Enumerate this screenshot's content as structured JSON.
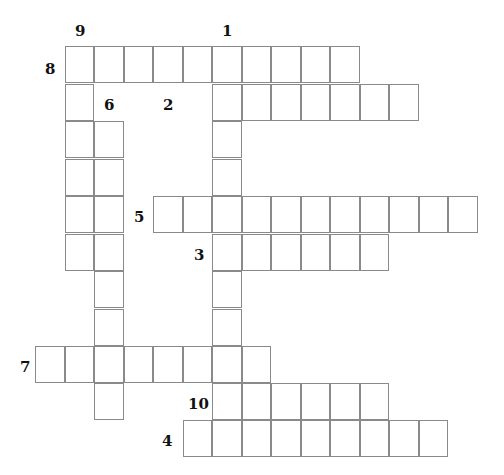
{
  "puzzle": {
    "type": "crossword",
    "grid": {
      "origin_x": 65,
      "cell_width": 29.5,
      "row_tops": [
        46,
        84,
        121,
        159,
        196,
        234,
        271,
        309,
        346,
        383,
        420
      ],
      "cell_height": 37.5
    },
    "clues": [
      {
        "number": "1",
        "direction": "down",
        "col": 5,
        "row": 0,
        "length": 11,
        "label_x": 222,
        "label_y": 22
      },
      {
        "number": "2",
        "direction": "across",
        "col": 5,
        "row": 1,
        "length": 7,
        "label_x": 163,
        "label_y": 96
      },
      {
        "number": "3",
        "direction": "across",
        "col": 5,
        "row": 5,
        "length": 6,
        "label_x": 194,
        "label_y": 246
      },
      {
        "number": "4",
        "direction": "across",
        "col": 4,
        "row": 10,
        "length": 9,
        "label_x": 162,
        "label_y": 432
      },
      {
        "number": "5",
        "direction": "across",
        "col": 3,
        "row": 4,
        "length": 11,
        "label_x": 134,
        "label_y": 208
      },
      {
        "number": "6",
        "direction": "down",
        "col": 1,
        "row": 2,
        "length": 8,
        "label_x": 104,
        "label_y": 96
      },
      {
        "number": "7",
        "direction": "across",
        "col": -1,
        "row": 8,
        "length": 8,
        "label_x": 20,
        "label_y": 358
      },
      {
        "number": "8",
        "direction": "across",
        "col": 0,
        "row": 0,
        "length": 10,
        "label_x": 45,
        "label_y": 60
      },
      {
        "number": "9",
        "direction": "down",
        "col": 0,
        "row": 0,
        "length": 6,
        "label_x": 75,
        "label_y": 22
      },
      {
        "number": "10",
        "direction": "across",
        "col": 5,
        "row": 9,
        "length": 6,
        "label_x": 188,
        "label_y": 395
      }
    ]
  }
}
